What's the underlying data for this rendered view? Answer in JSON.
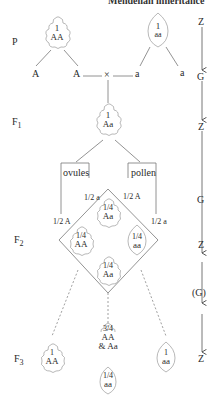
{
  "header": {
    "title": "Mendelian inheritance"
  },
  "generations": {
    "p": "P",
    "f1": "F",
    "f1_sub": "1",
    "f2": "F",
    "f2_sub": "2",
    "f3": "F",
    "f3_sub": "3"
  },
  "p_generation": {
    "left_plant": {
      "fraction": "1",
      "genotype": "AA"
    },
    "right_plant": {
      "fraction": "1",
      "genotype": "aa"
    },
    "gametes": [
      "A",
      "A",
      "a",
      "a"
    ],
    "cross_symbol": "×"
  },
  "f1_generation": {
    "plant": {
      "fraction": "1",
      "genotype": "Aa"
    },
    "ovules_label": "ovules",
    "pollen_label": "pollen",
    "ovule_gametes": [
      "1/2 A",
      "1/2 a"
    ],
    "pollen_gametes": [
      "1/2 A",
      "1/2 a"
    ]
  },
  "f2_generation": {
    "top": {
      "fraction": "1/4",
      "genotype": "Aa"
    },
    "left": {
      "fraction": "1/4",
      "genotype": "AA"
    },
    "right": {
      "fraction": "1/4",
      "genotype": "aa"
    },
    "bottom": {
      "fraction": "1/4",
      "genotype": "Aa"
    }
  },
  "f3_generation": {
    "left": {
      "fraction": "1",
      "genotype": "AA"
    },
    "middle_top": {
      "fraction": "3/4",
      "genotype": "AA",
      "genotype2": "& Aa"
    },
    "middle_bottom": {
      "fraction": "1/4",
      "genotype": "aa"
    },
    "right": {
      "fraction": "1",
      "genotype": "aa"
    }
  },
  "life_cycle": {
    "stages": [
      "Z",
      "G",
      "Z",
      "G",
      "Z",
      "(G)",
      "Z"
    ]
  }
}
